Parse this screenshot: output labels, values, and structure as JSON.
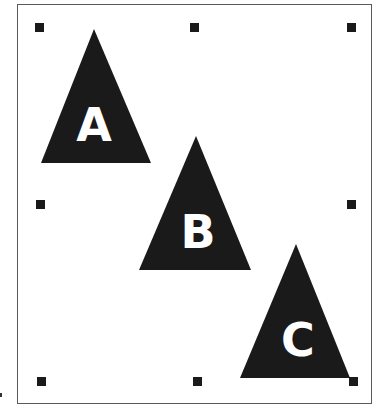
{
  "diagram": {
    "background": "#ffffff",
    "frame_color": "#5a5a5a",
    "shape_color": "#1a1a1a",
    "letter_color": "#ffffff",
    "shapes": [
      {
        "type": "triangle",
        "label": "A",
        "apex": [
          94,
          29
        ],
        "base_left": [
          41,
          163
        ],
        "base_right": [
          151,
          163
        ]
      },
      {
        "type": "triangle",
        "label": "B",
        "apex": [
          196,
          136
        ],
        "base_left": [
          139,
          270
        ],
        "base_right": [
          251,
          270
        ]
      },
      {
        "type": "triangle",
        "label": "C",
        "apex": [
          296,
          244
        ],
        "base_left": [
          240,
          378
        ],
        "base_right": [
          350,
          378
        ]
      }
    ],
    "selection_handles": [
      {
        "position": "top-left",
        "x": 35,
        "y": 23
      },
      {
        "position": "top-center",
        "x": 190,
        "y": 23
      },
      {
        "position": "top-right",
        "x": 347,
        "y": 23
      },
      {
        "position": "middle-left",
        "x": 36,
        "y": 200
      },
      {
        "position": "middle-right",
        "x": 347,
        "y": 200
      },
      {
        "position": "bottom-left",
        "x": 37,
        "y": 377
      },
      {
        "position": "bottom-center",
        "x": 193,
        "y": 377
      },
      {
        "position": "bottom-right",
        "x": 349,
        "y": 377
      }
    ]
  }
}
